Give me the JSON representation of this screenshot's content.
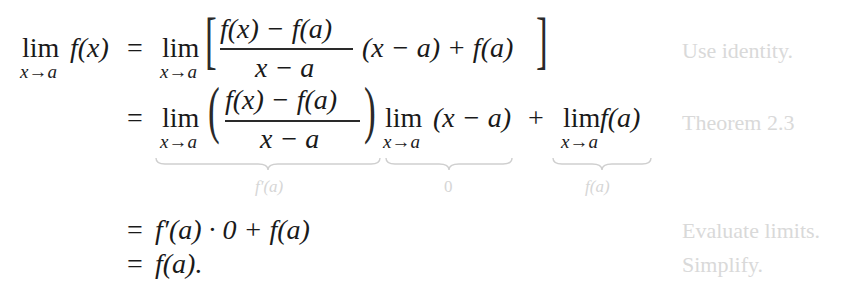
{
  "derivation": {
    "rows": [
      {
        "lhs": {
          "lim": "lim",
          "sub": "x→a",
          "func": "f(x)"
        },
        "rel": "=",
        "expr": {
          "lim": "lim",
          "sub": "x→a",
          "open": "[",
          "num": "f(x) − f(a)",
          "den": "x − a",
          "tail": "(x − a) + f(a)",
          "close": "]"
        },
        "note": "Use identity."
      },
      {
        "rel": "=",
        "expr": {
          "lim1": "lim",
          "sub1": "x→a",
          "open": "(",
          "num": "f(x) − f(a)",
          "den": "x − a",
          "close": ")",
          "lim2": "lim",
          "sub2": "x→a",
          "mid": "(x − a)",
          "plus": "+",
          "lim3": "lim",
          "sub3": "x→a",
          "tail": "f(a)"
        },
        "braces": [
          {
            "label": "f′(a)"
          },
          {
            "label": "0"
          },
          {
            "label": "f(a)"
          }
        ],
        "note": "Theorem 2.3"
      },
      {
        "rel": "=",
        "expr": "f′(a) · 0 + f(a)",
        "note": "Evaluate limits."
      },
      {
        "rel": "=",
        "expr": "f(a).",
        "note": "Simplify."
      }
    ]
  },
  "colors": {
    "math": "#1a1a1a",
    "annotation": "#d9d9d9"
  }
}
